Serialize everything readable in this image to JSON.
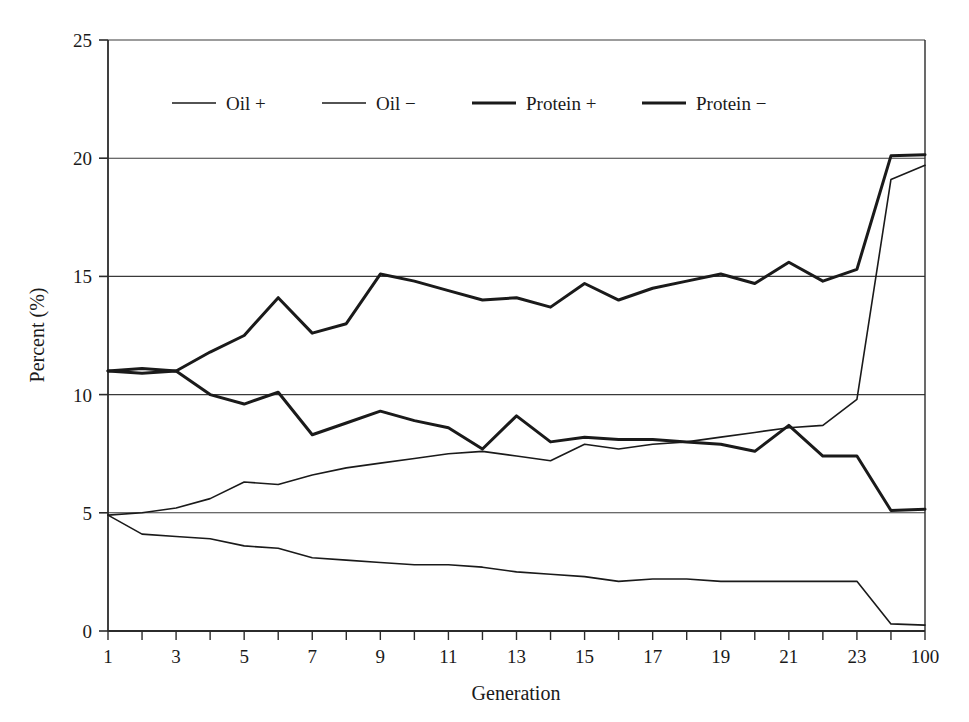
{
  "chart_data": {
    "type": "line",
    "title": "",
    "subtitle": "",
    "xlabel": "Generation",
    "ylabel": "Percent (%)",
    "xlim": [
      0,
      24
    ],
    "ylim": [
      0,
      25
    ],
    "ytick_labels": [
      "0",
      "5",
      "10",
      "15",
      "20",
      "25"
    ],
    "ytick_values": [
      0,
      5,
      10,
      15,
      20,
      25
    ],
    "xtick_labels": [
      "1",
      "",
      "3",
      "",
      "5",
      "",
      "7",
      "",
      "9",
      "",
      "11",
      "",
      "13",
      "",
      "15",
      "",
      "17",
      "",
      "19",
      "",
      "21",
      "",
      "23",
      "",
      "100"
    ],
    "x_categories": [
      "1",
      "2",
      "3",
      "4",
      "5",
      "6",
      "7",
      "8",
      "9",
      "10",
      "11",
      "12",
      "13",
      "14",
      "15",
      "16",
      "17",
      "18",
      "19",
      "20",
      "21",
      "22",
      "23",
      "24",
      "100"
    ],
    "grid": "horizontal",
    "legend_position": "top-inside",
    "series": [
      {
        "name": "Oil +",
        "line_width": 1.6,
        "color": "#1a1a1a",
        "values": [
          4.9,
          5.0,
          5.2,
          5.6,
          6.3,
          6.2,
          6.6,
          6.9,
          7.1,
          7.3,
          7.5,
          7.6,
          7.4,
          7.2,
          7.9,
          7.7,
          7.9,
          8.0,
          8.2,
          8.4,
          8.6,
          8.7,
          9.8,
          19.1,
          19.7
        ]
      },
      {
        "name": "Oil −",
        "line_width": 1.6,
        "color": "#1a1a1a",
        "values": [
          4.9,
          4.1,
          4.0,
          3.9,
          3.6,
          3.5,
          3.1,
          3.0,
          2.9,
          2.8,
          2.8,
          2.7,
          2.5,
          2.4,
          2.3,
          2.1,
          2.2,
          2.2,
          2.1,
          2.1,
          2.1,
          2.1,
          2.1,
          0.3,
          0.25
        ]
      },
      {
        "name": "Protein +",
        "line_width": 3.0,
        "color": "#1a1a1a",
        "values": [
          11.0,
          11.1,
          11.0,
          11.8,
          12.5,
          14.1,
          12.6,
          13.0,
          15.1,
          14.8,
          14.4,
          14.0,
          14.1,
          13.7,
          14.7,
          14.0,
          14.5,
          14.8,
          15.1,
          14.7,
          15.6,
          14.8,
          15.3,
          20.1,
          20.15
        ]
      },
      {
        "name": "Protein −",
        "line_width": 3.0,
        "color": "#1a1a1a",
        "values": [
          11.0,
          10.9,
          11.0,
          10.0,
          9.6,
          10.1,
          8.3,
          8.8,
          9.3,
          8.9,
          8.6,
          7.7,
          9.1,
          8.0,
          8.2,
          8.1,
          8.1,
          8.0,
          7.9,
          7.6,
          8.7,
          7.4,
          7.4,
          5.1,
          5.15
        ]
      }
    ],
    "legend_entries": [
      {
        "label": "Oil +",
        "line_width": 1.6
      },
      {
        "label": "Oil −",
        "line_width": 1.6
      },
      {
        "label": "Protein +",
        "line_width": 3.0
      },
      {
        "label": "Protein −",
        "line_width": 3.0
      }
    ]
  },
  "colors": {
    "ink": "#1a1a1a",
    "axis": "#2b2b2b",
    "grid": "#3a3a3a",
    "background": "#ffffff"
  }
}
